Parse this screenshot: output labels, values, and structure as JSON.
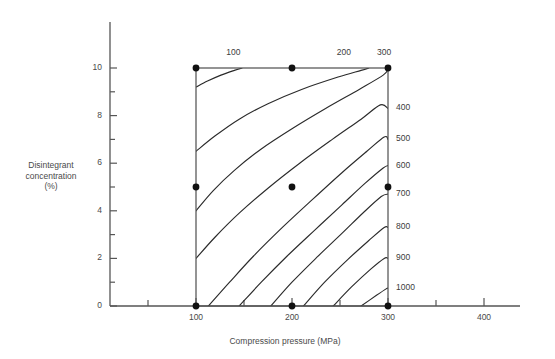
{
  "chart_data": {
    "type": "line",
    "title": "",
    "subtitle": "",
    "xlabel": "Compression pressure (MPa)",
    "ylabel": "Disintegrant concentration (%)",
    "ylabel_lines": [
      "Disintegrant",
      "concentration",
      "(%)"
    ],
    "xlim": [
      0,
      450
    ],
    "ylim": [
      0,
      11.6
    ],
    "grid": false,
    "legend": "none",
    "x_ticks": [
      {
        "value": 50,
        "label": ""
      },
      {
        "value": 100,
        "label": "100"
      },
      {
        "value": 150,
        "label": ""
      },
      {
        "value": 200,
        "label": "200"
      },
      {
        "value": 250,
        "label": ""
      },
      {
        "value": 300,
        "label": "300"
      },
      {
        "value": 350,
        "label": ""
      },
      {
        "value": 400,
        "label": "400"
      }
    ],
    "y_ticks": [
      {
        "value": 0,
        "label": "0"
      },
      {
        "value": 1,
        "label": ""
      },
      {
        "value": 2,
        "label": "2"
      },
      {
        "value": 3,
        "label": ""
      },
      {
        "value": 4,
        "label": "4"
      },
      {
        "value": 5,
        "label": ""
      },
      {
        "value": 6,
        "label": "6"
      },
      {
        "value": 7,
        "label": ""
      },
      {
        "value": 8,
        "label": "8"
      },
      {
        "value": 9,
        "label": ""
      },
      {
        "value": 10,
        "label": "10"
      }
    ],
    "plot_region": {
      "x_min": 100,
      "x_max": 300,
      "y_min": 0,
      "y_max": 10
    },
    "contour_levels": [
      100,
      200,
      300,
      400,
      500,
      600,
      700,
      800,
      900,
      1000
    ],
    "contour_top_labels": [
      {
        "level": 100,
        "x": 139
      },
      {
        "level": 200,
        "x": 254
      },
      {
        "level": 300,
        "x": 296
      }
    ],
    "contour_right_labels": [
      {
        "level": 400,
        "y": 8.3
      },
      {
        "level": 500,
        "y": 7.0
      },
      {
        "level": 600,
        "y": 5.9
      },
      {
        "level": 700,
        "y": 4.7
      },
      {
        "level": 800,
        "y": 3.3
      },
      {
        "level": 900,
        "y": 2.0
      },
      {
        "level": 1000,
        "y": 0.75
      }
    ],
    "contours": [
      {
        "level": 100,
        "points": [
          [
            100,
            9.2
          ],
          [
            112,
            9.45
          ],
          [
            126,
            9.7
          ],
          [
            140,
            9.9
          ],
          [
            148,
            10.0
          ]
        ]
      },
      {
        "level": 200,
        "points": [
          [
            100,
            6.5
          ],
          [
            120,
            7.15
          ],
          [
            145,
            7.85
          ],
          [
            175,
            8.5
          ],
          [
            210,
            9.1
          ],
          [
            248,
            9.62
          ],
          [
            272,
            9.9
          ],
          [
            280,
            10.0
          ]
        ]
      },
      {
        "level": 300,
        "points": [
          [
            100,
            4.0
          ],
          [
            118,
            4.85
          ],
          [
            140,
            5.7
          ],
          [
            168,
            6.6
          ],
          [
            200,
            7.45
          ],
          [
            235,
            8.3
          ],
          [
            270,
            9.1
          ],
          [
            295,
            9.7
          ],
          [
            300,
            9.95
          ]
        ]
      },
      {
        "level": 400,
        "points": [
          [
            100,
            2.0
          ],
          [
            120,
            2.9
          ],
          [
            145,
            3.9
          ],
          [
            175,
            4.95
          ],
          [
            208,
            6.0
          ],
          [
            242,
            7.0
          ],
          [
            272,
            7.85
          ],
          [
            292,
            8.45
          ],
          [
            300,
            8.3
          ]
        ]
      },
      {
        "level": 500,
        "points": [
          [
            113,
            0.0
          ],
          [
            135,
            1.0
          ],
          [
            160,
            2.1
          ],
          [
            190,
            3.3
          ],
          [
            222,
            4.5
          ],
          [
            252,
            5.6
          ],
          [
            278,
            6.5
          ],
          [
            296,
            7.1
          ],
          [
            300,
            7.0
          ]
        ]
      },
      {
        "level": 600,
        "points": [
          [
            145,
            0.0
          ],
          [
            168,
            1.0
          ],
          [
            195,
            2.1
          ],
          [
            224,
            3.2
          ],
          [
            252,
            4.25
          ],
          [
            276,
            5.15
          ],
          [
            295,
            5.8
          ],
          [
            300,
            5.9
          ]
        ]
      },
      {
        "level": 700,
        "points": [
          [
            178,
            0.0
          ],
          [
            200,
            1.0
          ],
          [
            226,
            2.05
          ],
          [
            252,
            3.05
          ],
          [
            275,
            3.95
          ],
          [
            293,
            4.6
          ],
          [
            300,
            4.7
          ]
        ]
      },
      {
        "level": 800,
        "points": [
          [
            212,
            0.0
          ],
          [
            234,
            1.0
          ],
          [
            258,
            1.95
          ],
          [
            280,
            2.75
          ],
          [
            296,
            3.3
          ],
          [
            300,
            3.3
          ]
        ]
      },
      {
        "level": 900,
        "points": [
          [
            243,
            0.0
          ],
          [
            262,
            0.8
          ],
          [
            282,
            1.55
          ],
          [
            296,
            2.0
          ],
          [
            300,
            2.0
          ]
        ]
      },
      {
        "level": 1000,
        "points": [
          [
            272,
            0.0
          ],
          [
            288,
            0.45
          ],
          [
            298,
            0.72
          ],
          [
            300,
            0.75
          ]
        ]
      }
    ],
    "design_points": [
      {
        "x": 100,
        "y": 10
      },
      {
        "x": 200,
        "y": 10
      },
      {
        "x": 300,
        "y": 10
      },
      {
        "x": 100,
        "y": 5
      },
      {
        "x": 200,
        "y": 5
      },
      {
        "x": 300,
        "y": 5
      },
      {
        "x": 100,
        "y": 0
      },
      {
        "x": 200,
        "y": 0
      },
      {
        "x": 300,
        "y": 0
      }
    ],
    "colors": {
      "axis": "#555555",
      "contour": "#2b2b2b",
      "point": "#111111",
      "text": "#4a4a4a",
      "background": "#ffffff"
    }
  }
}
